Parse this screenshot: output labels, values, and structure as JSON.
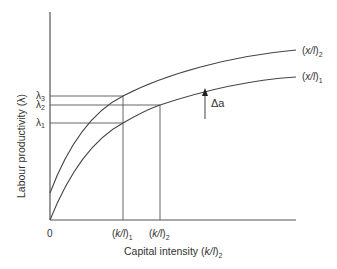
{
  "diagram": {
    "y_axis_label": "Labour productivity (λ)",
    "x_axis_label_main": "Capital intensity (",
    "x_axis_label_var": "k/l",
    "x_axis_label_close": ")",
    "x_axis_label_sub": "2",
    "origin_label": "0",
    "y_ticks": [
      {
        "symbol": "λ",
        "sub": "3"
      },
      {
        "symbol": "λ",
        "sub": "2"
      },
      {
        "symbol": "λ",
        "sub": "1"
      }
    ],
    "x_ticks": [
      {
        "pre": "(",
        "var": "k/l",
        "post": ")",
        "sub": "1"
      },
      {
        "pre": "(",
        "var": "k/l",
        "post": ")",
        "sub": "2"
      }
    ],
    "curves": [
      {
        "pre": "(",
        "var": "x/l",
        "post": ")",
        "sub": "2"
      },
      {
        "pre": "(",
        "var": "x/l",
        "post": ")",
        "sub": "1"
      }
    ],
    "shift_label": "Δa",
    "colors": {
      "axis": "#555555",
      "curve": "#444444",
      "guide": "#555555",
      "text": "#333333"
    }
  }
}
